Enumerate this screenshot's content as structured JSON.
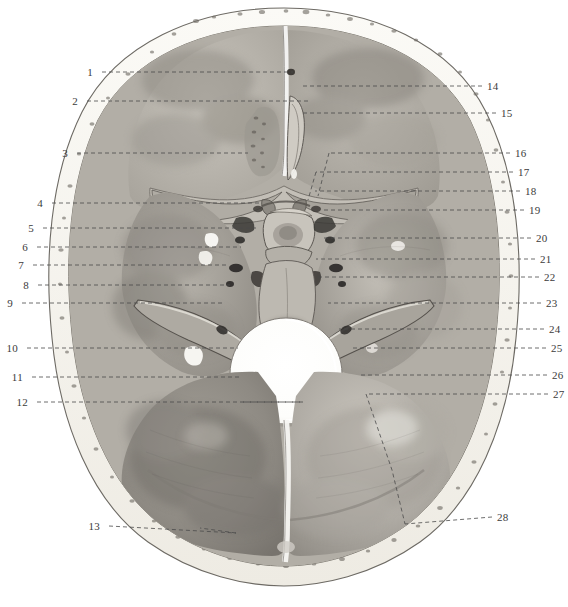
{
  "figure": {
    "view": "superior view of skull base, calvaria removed",
    "background_color": "#ffffff",
    "ink_color": "#4a4a4a",
    "bone_tone_light": "#e9e6df",
    "bone_tone_mid": "#b9b5ad",
    "bone_tone_dark": "#8a8780",
    "rim_color": "#f6f4ee"
  },
  "labels": {
    "left": [
      {
        "id": "1",
        "text": "1",
        "x": 93,
        "y": 72,
        "line_x2": 293,
        "line_y2": 72
      },
      {
        "id": "2",
        "text": "2",
        "x": 78,
        "y": 101,
        "line_x2": 310,
        "line_y2": 101
      },
      {
        "id": "3",
        "text": "3",
        "x": 68,
        "y": 153,
        "line_x2": 248,
        "line_y2": 153
      },
      {
        "id": "4",
        "text": "4",
        "x": 43,
        "y": 203,
        "line_x2": 262,
        "line_y2": 203
      },
      {
        "id": "5",
        "text": "5",
        "x": 34,
        "y": 228,
        "line_x2": 256,
        "line_y2": 228
      },
      {
        "id": "6",
        "text": "6",
        "x": 28,
        "y": 247,
        "line_x2": 241,
        "line_y2": 247
      },
      {
        "id": "7",
        "text": "7",
        "x": 24,
        "y": 265,
        "line_x2": 228,
        "line_y2": 265
      },
      {
        "id": "8",
        "text": "8",
        "x": 29,
        "y": 285,
        "line_x2": 230,
        "line_y2": 285
      },
      {
        "id": "9",
        "text": "9",
        "x": 13,
        "y": 303,
        "line_x2": 224,
        "line_y2": 303
      },
      {
        "id": "10",
        "text": "10",
        "x": 18,
        "y": 348,
        "line_x2": 238,
        "line_y2": 348
      },
      {
        "id": "11",
        "text": "11",
        "x": 23,
        "y": 377,
        "line_x2": 240,
        "line_y2": 377
      },
      {
        "id": "12",
        "text": "12",
        "x": 28,
        "y": 402,
        "line_x2": 303,
        "line_y2": 402
      },
      {
        "id": "13",
        "text": "13",
        "x": 100,
        "y": 526,
        "line_x2": 236,
        "line_y2": 533
      }
    ],
    "right": [
      {
        "id": "14",
        "text": "14",
        "x": 487,
        "y": 86,
        "line_x2": 300,
        "line_y2": 86
      },
      {
        "id": "15",
        "text": "15",
        "x": 501,
        "y": 113,
        "line_x2": 302,
        "line_y2": 113
      },
      {
        "id": "16",
        "text": "16",
        "x": 515,
        "y": 153,
        "line_x2": 329,
        "line_y2": 153
      },
      {
        "id": "17",
        "text": "17",
        "x": 518,
        "y": 172,
        "line_x2": 316,
        "line_y2": 172
      },
      {
        "id": "18",
        "text": "18",
        "x": 525,
        "y": 191,
        "line_x2": 315,
        "line_y2": 191
      },
      {
        "id": "19",
        "text": "19",
        "x": 529,
        "y": 210,
        "line_x2": 322,
        "line_y2": 210
      },
      {
        "id": "20",
        "text": "20",
        "x": 536,
        "y": 238,
        "line_x2": 323,
        "line_y2": 238
      },
      {
        "id": "21",
        "text": "21",
        "x": 540,
        "y": 259,
        "line_x2": 316,
        "line_y2": 259
      },
      {
        "id": "22",
        "text": "22",
        "x": 544,
        "y": 277,
        "line_x2": 318,
        "line_y2": 277
      },
      {
        "id": "23",
        "text": "23",
        "x": 546,
        "y": 303,
        "line_x2": 328,
        "line_y2": 303
      },
      {
        "id": "24",
        "text": "24",
        "x": 549,
        "y": 329,
        "line_x2": 339,
        "line_y2": 329
      },
      {
        "id": "25",
        "text": "25",
        "x": 551,
        "y": 348,
        "line_x2": 352,
        "line_y2": 348
      },
      {
        "id": "26",
        "text": "26",
        "x": 552,
        "y": 375,
        "line_x2": 359,
        "line_y2": 375
      },
      {
        "id": "27",
        "text": "27",
        "x": 553,
        "y": 394,
        "line_x2": 366,
        "line_y2": 394
      },
      {
        "id": "28",
        "text": "28",
        "x": 497,
        "y": 517,
        "line_x2": 405,
        "line_y2": 524
      }
    ]
  },
  "structures": {
    "anterior_fossa": "anterior cranial fossa",
    "middle_fossa": "middle cranial fossa",
    "posterior_fossa": "posterior cranial fossa",
    "crista_galli": "crista galli",
    "cribriform_plate": "cribriform plate of ethmoid",
    "sella_turcica": "sella turcica / hypophysial fossa",
    "foramen_magnum": "foramen magnum",
    "petrous_ridge": "petrous part of temporal bone",
    "clivus": "clivus",
    "internal_occipital_crest": "internal occipital crest"
  }
}
